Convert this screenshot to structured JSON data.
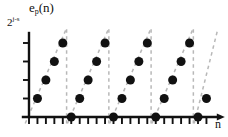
{
  "figure": {
    "title": "",
    "background_color": "#ffffff",
    "ink_color": "#111111",
    "dash_color": "#b8b8b8"
  },
  "labels": {
    "y_axis_name": "e",
    "y_axis_name_sub": "p",
    "y_axis_name_arg": "(n)",
    "y_axis_name_full": "e_p(n)",
    "y_tick_top_base": "2",
    "y_tick_top_exponent": "j-s",
    "y_tick_top_full": "2^(j-s)",
    "x_axis_name": "n"
  },
  "chart_data": {
    "type": "scatter",
    "title": "",
    "xlabel": "n",
    "ylabel": "e_p(n)",
    "xlim": [
      0,
      24
    ],
    "ylim": [
      0,
      5
    ],
    "grid": false,
    "legend": false,
    "axis_arrow_x": true,
    "axis_arrow_y": false,
    "y_ticks": [
      0,
      1,
      2,
      3,
      4
    ],
    "y_tick_labels": [
      "",
      "",
      "",
      "",
      "2^(j-s)"
    ],
    "x_ticks": [
      0,
      1,
      2,
      3,
      4,
      5,
      6,
      7,
      8,
      9,
      10,
      11,
      12,
      13,
      14,
      15,
      16,
      17,
      18,
      19,
      20,
      21
    ],
    "x_tick_labels": [],
    "period": 5,
    "marker": "filled-circle",
    "marker_size_px": 9,
    "connector_style": "dashed",
    "x": [
      1,
      2,
      3,
      4,
      5,
      6,
      7,
      8,
      9,
      10,
      11,
      12,
      13,
      14,
      15,
      16,
      17,
      18,
      19,
      20,
      21
    ],
    "y": [
      1,
      2,
      3,
      4,
      0,
      1,
      2,
      3,
      4,
      0,
      1,
      2,
      3,
      4,
      0,
      1,
      2,
      3,
      4,
      0,
      1
    ],
    "series": [
      {
        "name": "e_p(n)",
        "values": [
          1,
          2,
          3,
          4,
          0,
          1,
          2,
          3,
          4,
          0,
          1,
          2,
          3,
          4,
          0,
          1,
          2,
          3,
          4,
          0,
          1
        ]
      }
    ],
    "zero_crossing_samples": [
      5,
      10,
      15,
      20
    ],
    "peak_samples": [
      4,
      9,
      14,
      19
    ],
    "peak_value_label": "2^(j-s)"
  }
}
